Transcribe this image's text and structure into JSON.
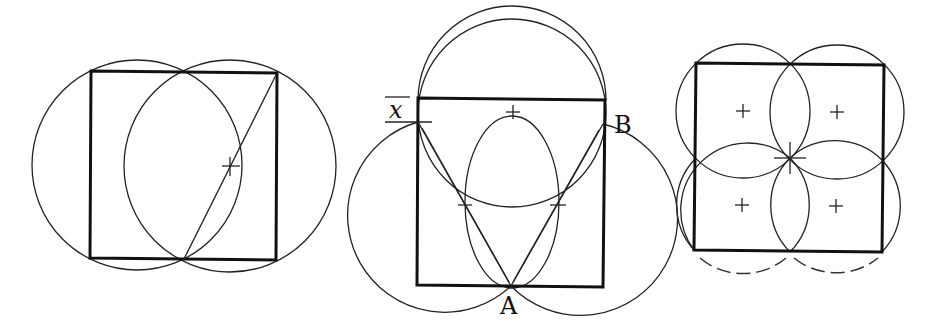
{
  "figures": [
    {
      "id": "figure-1",
      "description": "Square with two overlapping circles and a diagonal",
      "square": {
        "x": 91,
        "y": 72,
        "w": 186,
        "h": 187
      },
      "circles": [
        {
          "cx": 137,
          "cy": 165,
          "r": 105
        },
        {
          "cx": 230,
          "cy": 166,
          "r": 106
        }
      ],
      "lines": [
        {
          "x1": 184,
          "y1": 259,
          "x2": 277,
          "y2": 73
        }
      ],
      "crosses": [
        {
          "x": 230,
          "y": 166
        }
      ]
    },
    {
      "id": "figure-2",
      "description": "Square with semicircle above and three circles, labeled A, B, x",
      "square": {
        "x": 418,
        "y": 99,
        "w": 186,
        "h": 187
      },
      "labels": {
        "x": "x",
        "A": "A",
        "B": "B"
      },
      "arcs": [
        {
          "cx": 512,
          "cy": 100,
          "r": 94,
          "type": "top-semicircle"
        }
      ],
      "circles": [
        {
          "cx": 512,
          "cy": 115,
          "r": 94
        },
        {
          "cx": 465,
          "cy": 205,
          "r": 97
        },
        {
          "cx": 557,
          "cy": 205,
          "r": 95
        },
        {
          "cx": 512,
          "cy": 210,
          "r": 47
        }
      ],
      "lines": [
        {
          "x1": 418,
          "y1": 122,
          "x2": 511,
          "y2": 286
        },
        {
          "x1": 603,
          "y1": 124,
          "x2": 511,
          "y2": 286
        }
      ],
      "ticks": [
        {
          "x": 513,
          "y": 112,
          "type": "plus"
        },
        {
          "x": 465,
          "y": 205,
          "type": "dash"
        },
        {
          "x": 557,
          "y": 205,
          "type": "dash"
        }
      ]
    },
    {
      "id": "figure-3",
      "description": "Square divided into four quadrant circles",
      "square": {
        "x": 696,
        "y": 64,
        "w": 187,
        "h": 187
      },
      "circles": [
        {
          "cx": 743,
          "cy": 111,
          "r": 67
        },
        {
          "cx": 837,
          "cy": 112,
          "r": 67
        },
        {
          "cx": 742,
          "cy": 205,
          "r": 67
        },
        {
          "cx": 836,
          "cy": 206,
          "r": 67
        }
      ],
      "crosses": [
        {
          "x": 743,
          "y": 111
        },
        {
          "x": 837,
          "y": 112
        },
        {
          "x": 742,
          "y": 205
        },
        {
          "x": 836,
          "y": 206
        }
      ],
      "center_star": {
        "x": 790,
        "y": 158
      }
    }
  ]
}
